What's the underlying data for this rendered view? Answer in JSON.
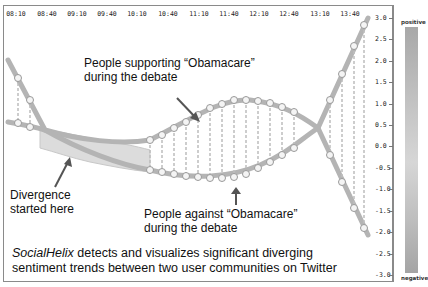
{
  "chart_data": {
    "type": "line",
    "title": "SocialHelix",
    "x": [
      "08:10",
      "08:40",
      "09:10",
      "09:40",
      "10:10",
      "10:40",
      "11:10",
      "11:40",
      "12:10",
      "12:40",
      "13:10",
      "13:40"
    ],
    "xlabel": "",
    "ylabel": "",
    "ylim": [
      -3.0,
      3.0
    ],
    "yticks": [
      "3.0",
      "2.5",
      "2.0",
      "1.5",
      "1.0",
      "0.5",
      "0.0",
      "-0.5",
      "-1.0",
      "-1.5",
      "-2.0",
      "-2.5",
      "-3.0"
    ],
    "grid": false,
    "series": [
      {
        "name": "People supporting “Obamacare” during the debate",
        "values": [
          2.0,
          0.8,
          0.2,
          0.3,
          0.6,
          1.0,
          1.3,
          1.1,
          0.8,
          0.5,
          1.6,
          3.0
        ]
      },
      {
        "name": "People against “Obamacare” during the debate",
        "values": [
          0.7,
          0.0,
          -0.3,
          -0.4,
          -0.6,
          -0.7,
          -0.7,
          -0.5,
          -0.1,
          0.5,
          -1.3,
          -2.3
        ]
      }
    ],
    "colorbar": {
      "top_label": "positive",
      "bottom_label": "negative"
    },
    "annotations": [
      "People supporting “Obamacare” during the debate",
      "Divergence started here",
      "People against “Obamacare” during the debate"
    ]
  },
  "axis": {
    "time_ticks": [
      {
        "label": "08:10",
        "x": 16
      },
      {
        "label": "08:40",
        "x": 47
      },
      {
        "label": "09:10",
        "x": 77
      },
      {
        "label": "09:40",
        "x": 107
      },
      {
        "label": "10:10",
        "x": 137
      },
      {
        "label": "10:40",
        "x": 168
      },
      {
        "label": "11:10",
        "x": 199
      },
      {
        "label": "11:40",
        "x": 229
      },
      {
        "label": "12:10",
        "x": 259
      },
      {
        "label": "12:40",
        "x": 289
      },
      {
        "label": "13:10",
        "x": 320
      },
      {
        "label": "13:40",
        "x": 350
      }
    ],
    "y_ticks": [
      {
        "label": "3.0",
        "y": 18
      },
      {
        "label": "2.5",
        "y": 39
      },
      {
        "label": "2.0",
        "y": 61
      },
      {
        "label": "1.5",
        "y": 82
      },
      {
        "label": "1.0",
        "y": 104
      },
      {
        "label": "0.5",
        "y": 125
      },
      {
        "label": "0.0",
        "y": 146
      },
      {
        "label": "-0.5",
        "y": 168
      },
      {
        "label": "-1.0",
        "y": 189
      },
      {
        "label": "-1.5",
        "y": 211
      },
      {
        "label": "-2.0",
        "y": 232
      },
      {
        "label": "-2.5",
        "y": 254
      },
      {
        "label": "-3.0",
        "y": 275
      }
    ]
  },
  "annotations": {
    "supporters_line1": "People supporting “Obamacare”",
    "supporters_line2": "during the debate",
    "divergence_line1": "Divergence",
    "divergence_line2": "started here",
    "against_line1": "People against “Obamacare”",
    "against_line2": "during the debate"
  },
  "caption": {
    "brand": "SocialHelix",
    "line1_rest": " detects and visualizes significant diverging",
    "line2": "sentiment trends between two user communities on Twitter"
  },
  "colorbar": {
    "top_label": "positive",
    "bottom_label": "negative"
  },
  "colors": {
    "strand": "#a9a9a9",
    "strand_dark": "#8c8c8c",
    "arrow": "#555555",
    "frame": "#8a8a8a"
  }
}
